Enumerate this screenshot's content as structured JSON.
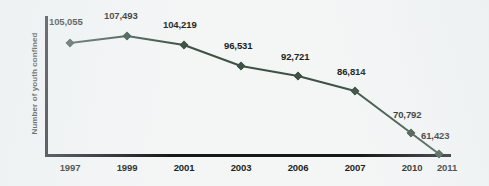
{
  "chart_data": {
    "type": "line",
    "title": "",
    "subtitle": "",
    "xlabel": "",
    "ylabel": "Number of youth confined",
    "categories": [
      "1997",
      "1999",
      "2001",
      "2003",
      "2006",
      "2007",
      "2010",
      "2011"
    ],
    "values": [
      105055,
      107493,
      104219,
      96531,
      92721,
      86814,
      70792,
      61423
    ],
    "value_labels": [
      "105,055",
      "107,493",
      "104,219",
      "96,531",
      "92,721",
      "86,814",
      "70,792",
      "61,423"
    ],
    "series": [
      {
        "name": "Number of youth confined",
        "values": [
          105055,
          107493,
          104219,
          96531,
          92721,
          86814,
          70792,
          61423
        ]
      }
    ],
    "ylim": [
      55000,
      112000
    ],
    "grid": false,
    "legend": false,
    "legend_position": "none",
    "marker": "diamond",
    "line_color": "#3d5245",
    "marker_color": "#3d5245",
    "axis_color": "#15181a",
    "background_color": "#f4f6f6",
    "text_color": "#1b1f21"
  },
  "axis": {
    "y_title": "Number of youth confined"
  },
  "points": [
    {
      "category": "1997",
      "value": 105055,
      "label": "105,055",
      "x": 70,
      "y": 43,
      "label_x": 49,
      "label_y": 16
    },
    {
      "category": "1999",
      "value": 107493,
      "label": "107,493",
      "x": 127,
      "y": 36,
      "label_x": 104,
      "label_y": 10
    },
    {
      "category": "2001",
      "value": 104219,
      "label": "104,219",
      "x": 184,
      "y": 45,
      "label_x": 163,
      "label_y": 19
    },
    {
      "category": "2003",
      "value": 96531,
      "label": "96,531",
      "x": 241,
      "y": 66,
      "label_x": 224,
      "label_y": 40
    },
    {
      "category": "2006",
      "value": 92721,
      "label": "92,721",
      "x": 298,
      "y": 76,
      "label_x": 281,
      "label_y": 51
    },
    {
      "category": "2007",
      "value": 86814,
      "label": "86,814",
      "x": 355,
      "y": 91,
      "label_x": 337,
      "label_y": 66
    },
    {
      "category": "2010",
      "value": 70792,
      "label": "70,792",
      "x": 411,
      "y": 133,
      "label_x": 393,
      "label_y": 109
    },
    {
      "category": "2011",
      "value": 61423,
      "label": "61,423",
      "x": 439,
      "y": 154,
      "label_x": 421,
      "label_y": 130
    }
  ],
  "ticks": [
    {
      "label": "1997",
      "x": 70
    },
    {
      "label": "1999",
      "x": 127
    },
    {
      "label": "2001",
      "x": 184
    },
    {
      "label": "2003",
      "x": 241
    },
    {
      "label": "2006",
      "x": 298
    },
    {
      "label": "2007",
      "x": 355
    },
    {
      "label": "2010",
      "x": 412
    },
    {
      "label": "2011",
      "x": 447
    }
  ]
}
